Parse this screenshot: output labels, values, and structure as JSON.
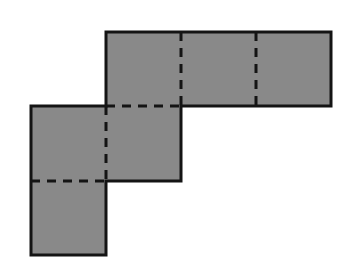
{
  "figure": {
    "canvas": {
      "width": 347,
      "height": 267
    },
    "colors": {
      "background": "#ffffff",
      "square_fill": "#898989",
      "outline_stroke": "#141414",
      "fold_line_stroke": "#141414"
    },
    "geometry": {
      "unit_square_size": 75,
      "stroke_width_outline": 3,
      "stroke_width_fold": 3,
      "fold_dash_pattern": "9 7"
    },
    "squares": [
      {
        "name": "top-left-square",
        "x": 106,
        "y": 32,
        "w": 75,
        "h": 74
      },
      {
        "name": "top-middle-square",
        "x": 181,
        "y": 32,
        "w": 75,
        "h": 74
      },
      {
        "name": "top-right-square",
        "x": 256,
        "y": 32,
        "w": 75,
        "h": 74
      },
      {
        "name": "middle-left-square",
        "x": 31,
        "y": 106,
        "w": 75,
        "h": 75
      },
      {
        "name": "middle-mid-square",
        "x": 106,
        "y": 106,
        "w": 75,
        "h": 75
      },
      {
        "name": "bottom-left-square",
        "x": 31,
        "y": 181,
        "w": 75,
        "h": 74
      }
    ],
    "outline_path": "M 106 32 L 331 32 L 331 106 L 181 106 L 181 181 L 106 181 L 106 255 L 31 255 L 31 106 L 106 106 Z",
    "fold_lines": [
      {
        "name": "fold-top-vertical-1",
        "x1": 181,
        "y1": 32,
        "x2": 181,
        "y2": 106
      },
      {
        "name": "fold-top-vertical-2",
        "x1": 256,
        "y1": 32,
        "x2": 256,
        "y2": 106
      },
      {
        "name": "fold-horizontal-upper",
        "x1": 106,
        "y1": 106,
        "x2": 181,
        "y2": 106
      },
      {
        "name": "fold-mid-vertical",
        "x1": 106,
        "y1": 106,
        "x2": 106,
        "y2": 181
      },
      {
        "name": "fold-horizontal-lower",
        "x1": 31,
        "y1": 181,
        "x2": 106,
        "y2": 181
      }
    ],
    "square_count": 6,
    "labels": []
  }
}
